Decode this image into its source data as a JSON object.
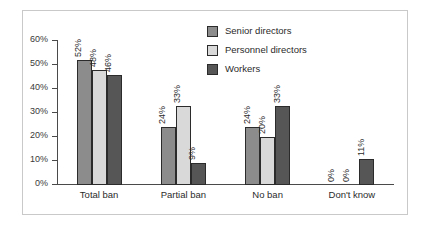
{
  "chart_data": {
    "type": "bar",
    "title": "",
    "subtitle": "",
    "xlabel": "",
    "ylabel": "",
    "categories": [
      "Total ban",
      "Partial ban",
      "No ban",
      "Don't know"
    ],
    "series": [
      {
        "name": "Senior directors",
        "color": "#8c8c8c",
        "values": [
          52,
          24,
          24,
          0
        ],
        "labels": [
          "52%",
          "24%",
          "24%",
          "0%"
        ]
      },
      {
        "name": "Personnel directors",
        "color": "#d9d9d9",
        "values": [
          48,
          33,
          20,
          0
        ],
        "labels": [
          "48%",
          "33%",
          "20%",
          "0%"
        ]
      },
      {
        "name": "Workers",
        "color": "#565656",
        "values": [
          46,
          9,
          33,
          11
        ],
        "labels": [
          "46%",
          "9%",
          "33%",
          "11%"
        ]
      }
    ],
    "ylim": [
      0,
      60
    ],
    "ytick_values": [
      0,
      10,
      20,
      30,
      40,
      50,
      60
    ],
    "ytick_labels": [
      "0%",
      "10%",
      "20%",
      "30%",
      "40%",
      "50%",
      "60%"
    ],
    "grid": false,
    "legend_position": "top-right",
    "bar_label_rotation": 90,
    "frame_color": "#c9c9c9",
    "axis_color": "#4a4a4a",
    "background": "#ffffff"
  }
}
